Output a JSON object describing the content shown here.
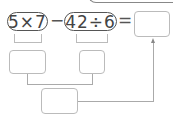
{
  "expression": {
    "term1": "5×7",
    "operator1": "−",
    "term2": "42÷6",
    "equals": "="
  },
  "answer_box": "",
  "intermediate_boxes": [
    "",
    ""
  ],
  "result_box": "",
  "colors": {
    "stroke": "#555555",
    "box_border": "#bbbbbb"
  }
}
